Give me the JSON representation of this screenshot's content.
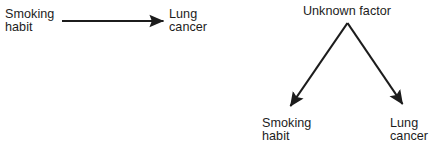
{
  "figure": {
    "background_color": "#ffffff",
    "ink_color": "#1c1c1c",
    "width": 439,
    "height": 152
  },
  "panels": [
    {
      "id": "direct-causation",
      "name": "direct-causation-diagram",
      "nodes": [
        {
          "id": "smoking-habit",
          "name": "node-smoking-habit",
          "lines": [
            "Smoking",
            "habit"
          ],
          "text": "Smoking\nhabit",
          "x": 5,
          "y": 8
        },
        {
          "id": "lung-cancer",
          "name": "node-lung-cancer",
          "lines": [
            "Lung",
            "cancer"
          ],
          "text": "Lung\ncancer",
          "x": 169,
          "y": 8
        }
      ],
      "edges": [
        {
          "id": "smoking-to-cancer",
          "name": "arrow-smoking-to-lung-cancer",
          "from": "smoking-habit",
          "to": "lung-cancer",
          "x1": 62,
          "y1": 21,
          "x2": 166,
          "y2": 21,
          "stroke_width": 2.2,
          "arrowhead": "filled-triangle"
        }
      ]
    },
    {
      "id": "common-cause",
      "name": "common-cause-diagram",
      "nodes": [
        {
          "id": "unknown-factor",
          "name": "node-unknown-factor",
          "lines": [
            "Unknown factor"
          ],
          "text": "Unknown factor",
          "x": 347,
          "y": 5,
          "anchor": "center"
        },
        {
          "id": "smoking-habit-2",
          "name": "node-smoking-habit",
          "lines": [
            "Smoking",
            "habit"
          ],
          "text": "Smoking\nhabit",
          "x": 262,
          "y": 117
        },
        {
          "id": "lung-cancer-2",
          "name": "node-lung-cancer",
          "lines": [
            "Lung",
            "cancer"
          ],
          "text": "Lung\ncancer",
          "x": 390,
          "y": 117
        }
      ],
      "edges": [
        {
          "id": "unknown-to-smoking",
          "name": "arrow-unknown-factor-to-smoking-habit",
          "from": "unknown-factor",
          "to": "smoking-habit-2",
          "x1": 347,
          "y1": 23,
          "x2": 288,
          "y2": 110,
          "stroke_width": 2.2,
          "arrowhead": "filled-triangle"
        },
        {
          "id": "unknown-to-cancer",
          "name": "arrow-unknown-factor-to-lung-cancer",
          "from": "unknown-factor",
          "to": "lung-cancer-2",
          "x1": 347,
          "y1": 23,
          "x2": 405,
          "y2": 108,
          "stroke_width": 2.2,
          "arrowhead": "filled-triangle"
        }
      ]
    }
  ]
}
